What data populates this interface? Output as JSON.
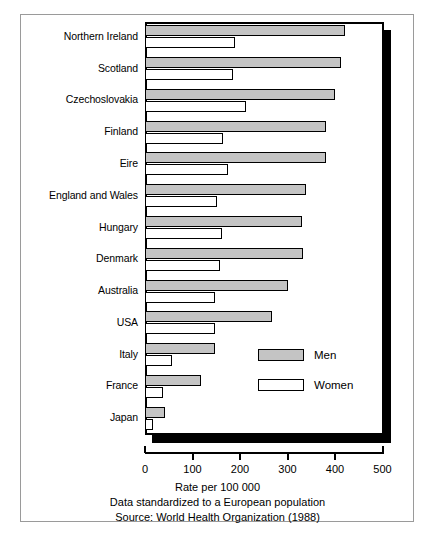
{
  "chart_data": {
    "type": "bar",
    "orientation": "horizontal",
    "title": "",
    "xlabel": "Rate per 100 000",
    "ylabel": "",
    "xlim": [
      0,
      500
    ],
    "xticks": [
      0,
      100,
      200,
      300,
      400,
      500
    ],
    "xtick_labels": [
      "0",
      "100",
      "200",
      "300",
      "400",
      "500"
    ],
    "grid": false,
    "legend_position": "inside-lower-right",
    "categories": [
      "Northern Ireland",
      "Scotland",
      "Czechoslovakia",
      "Finland",
      "Eire",
      "England and Wales",
      "Hungary",
      "Denmark",
      "Australia",
      "USA",
      "Italy",
      "France",
      "Japan"
    ],
    "series": [
      {
        "name": "Men",
        "color": "#c4c4c4",
        "values": [
          420,
          413,
          399,
          380,
          382,
          338,
          331,
          333,
          300,
          268,
          148,
          118,
          42
        ]
      },
      {
        "name": "Women",
        "color": "#ffffff",
        "values": [
          190,
          186,
          213,
          165,
          175,
          152,
          162,
          158,
          148,
          148,
          57,
          37,
          17
        ]
      }
    ],
    "annotations": [
      "Data standardized to a European population",
      "Source: World Health Organization (1988)"
    ]
  },
  "legend": {
    "items": [
      {
        "label": "Men",
        "swatch": "men"
      },
      {
        "label": "Women",
        "swatch": "women"
      }
    ]
  },
  "footer": {
    "axis_title": "Rate per 100 000",
    "note": "Data standardized to a European population",
    "source": "Source: World Health Organization (1988)"
  }
}
